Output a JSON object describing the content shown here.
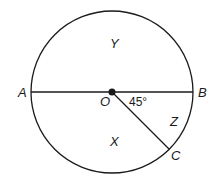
{
  "diagram": {
    "points": {
      "A": "A",
      "B": "B",
      "C": "C",
      "O": "O"
    },
    "regions": {
      "X": "X",
      "Y": "Y",
      "Z": "Z"
    },
    "angle_label": "45°",
    "colors": {
      "stroke": "#1a1a1a",
      "background": "#ffffff"
    }
  }
}
